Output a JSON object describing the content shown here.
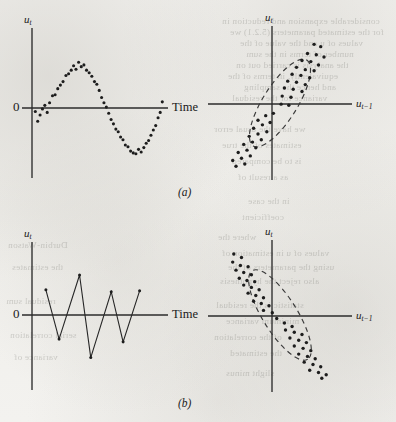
{
  "figure": {
    "background_color": "#f2f1ee",
    "ink_color": "#1d1d1d",
    "panels": [
      {
        "id": "a",
        "caption": "(a)",
        "caption_pos": {
          "x": 178,
          "y": 186
        },
        "charts": [
          {
            "id": "a-left",
            "role": "time-series",
            "y_axis_label": "u",
            "y_axis_sub": "t",
            "x_axis_label": "Time",
            "zero_label": "0"
          },
          {
            "id": "a-right",
            "role": "lag-scatter",
            "y_axis_label": "u",
            "y_axis_sub": "t",
            "x_axis_label": "u",
            "x_axis_sub": "t−1"
          }
        ]
      },
      {
        "id": "b",
        "caption": "(b)",
        "caption_pos": {
          "x": 178,
          "y": 397
        },
        "charts": [
          {
            "id": "b-left",
            "role": "time-series",
            "y_axis_label": "u",
            "y_axis_sub": "t",
            "x_axis_label": "Time",
            "zero_label": "0"
          },
          {
            "id": "b-right",
            "role": "lag-scatter",
            "y_axis_label": "u",
            "y_axis_sub": "t",
            "x_axis_label": "u",
            "x_axis_sub": "t−1"
          }
        ]
      }
    ]
  },
  "labels": {
    "a_left_y": "u",
    "a_left_y_sub": "t",
    "a_left_zero": "0",
    "a_left_x": "Time",
    "a_right_y": "u",
    "a_right_y_sub": "t",
    "a_right_x": "u",
    "a_right_x_sub": "t−1",
    "caption_a": "(a)",
    "b_left_y": "u",
    "b_left_y_sub": "t",
    "b_left_zero": "0",
    "b_left_x": "Time",
    "b_right_y": "u",
    "b_right_y_sub": "t",
    "b_right_x": "u",
    "b_right_x_sub": "t−1",
    "caption_b": "(b)"
  },
  "bleed_text": {
    "lines": [
      {
        "t": "considerable expansion and reduction in",
        "x": 222,
        "y": 16
      },
      {
        "t": "for the estimated parameters (5.2.1) we",
        "x": 230,
        "y": 27
      },
      {
        "t": "values of u and the value of the",
        "x": 240,
        "y": 38
      },
      {
        "t": "number of terms in the sum",
        "x": 246,
        "y": 49
      },
      {
        "t": "the analysis is carried out on",
        "x": 236,
        "y": 60
      },
      {
        "t": "equivalently, in terms of the",
        "x": 228,
        "y": 71
      },
      {
        "t": "and hence the sampling",
        "x": 244,
        "y": 82
      },
      {
        "t": "variance for the residual",
        "x": 232,
        "y": 93
      },
      {
        "t": "we have the usual error",
        "x": 214,
        "y": 124
      },
      {
        "t": "estimates of the true",
        "x": 222,
        "y": 140
      },
      {
        "t": "is to be compared",
        "x": 232,
        "y": 156
      },
      {
        "t": "as a result of",
        "x": 238,
        "y": 172
      },
      {
        "t": "in the case",
        "x": 248,
        "y": 196
      },
      {
        "t": "coefficient",
        "x": 242,
        "y": 212
      },
      {
        "t": "where the",
        "x": 218,
        "y": 232
      },
      {
        "t": "values of u in estimation of",
        "x": 222,
        "y": 248
      },
      {
        "t": "using the parameters of the",
        "x": 228,
        "y": 262
      },
      {
        "t": "also reject the hypothesis",
        "x": 220,
        "y": 276
      },
      {
        "t": "statistic is the residual",
        "x": 216,
        "y": 300
      },
      {
        "t": "minimum variance",
        "x": 226,
        "y": 316
      },
      {
        "t": "of the correlation",
        "x": 214,
        "y": 332
      },
      {
        "t": "the estimated",
        "x": 230,
        "y": 348
      },
      {
        "t": "slight minus",
        "x": 226,
        "y": 368
      },
      {
        "t": "Durbin-Watson",
        "x": 8,
        "y": 240
      },
      {
        "t": "the estimates",
        "x": 12,
        "y": 262
      },
      {
        "t": "residual sum",
        "x": 6,
        "y": 296
      },
      {
        "t": "serial correlation",
        "x": 10,
        "y": 330
      },
      {
        "t": "variance of",
        "x": 14,
        "y": 352
      }
    ]
  },
  "chart_data": [
    {
      "id": "a-left",
      "type": "scatter",
      "title": "",
      "xlabel": "Time",
      "ylabel": "u_t",
      "grid": false,
      "legend": null,
      "description": "Positive autocorrelation: residuals trace a smooth sine-like wave over time.",
      "xlim": [
        0,
        1
      ],
      "ylim": [
        -1.25,
        1.25
      ],
      "points": [
        [
          0.01,
          -0.08
        ],
        [
          0.028,
          -0.3
        ],
        [
          0.046,
          -0.16
        ],
        [
          0.064,
          -0.02
        ],
        [
          0.082,
          0.06
        ],
        [
          0.1,
          -0.1
        ],
        [
          0.118,
          0.12
        ],
        [
          0.14,
          0.28
        ],
        [
          0.16,
          0.3
        ],
        [
          0.18,
          0.44
        ],
        [
          0.2,
          0.52
        ],
        [
          0.22,
          0.6
        ],
        [
          0.242,
          0.74
        ],
        [
          0.262,
          0.78
        ],
        [
          0.282,
          0.86
        ],
        [
          0.3,
          0.96
        ],
        [
          0.318,
          0.88
        ],
        [
          0.338,
          1.04
        ],
        [
          0.358,
          0.94
        ],
        [
          0.378,
          0.98
        ],
        [
          0.398,
          0.86
        ],
        [
          0.418,
          0.8
        ],
        [
          0.438,
          0.72
        ],
        [
          0.458,
          0.6
        ],
        [
          0.476,
          0.54
        ],
        [
          0.494,
          0.4
        ],
        [
          0.512,
          0.24
        ],
        [
          0.53,
          0.12
        ],
        [
          0.548,
          0.02
        ],
        [
          0.566,
          -0.12
        ],
        [
          0.584,
          -0.26
        ],
        [
          0.602,
          -0.36
        ],
        [
          0.62,
          -0.48
        ],
        [
          0.638,
          -0.54
        ],
        [
          0.656,
          -0.66
        ],
        [
          0.674,
          -0.72
        ],
        [
          0.692,
          -0.84
        ],
        [
          0.712,
          -0.88
        ],
        [
          0.732,
          -0.98
        ],
        [
          0.752,
          -1.02
        ],
        [
          0.772,
          -1.04
        ],
        [
          0.792,
          -0.94
        ],
        [
          0.812,
          -1.0
        ],
        [
          0.832,
          -0.9
        ],
        [
          0.85,
          -0.8
        ],
        [
          0.868,
          -0.74
        ],
        [
          0.886,
          -0.62
        ],
        [
          0.904,
          -0.5
        ],
        [
          0.922,
          -0.4
        ],
        [
          0.94,
          -0.22
        ],
        [
          0.956,
          -0.1
        ],
        [
          0.972,
          0.14
        ]
      ]
    },
    {
      "id": "a-right",
      "type": "scatter",
      "title": "",
      "xlabel": "u_{t-1}",
      "ylabel": "u_t",
      "grid": false,
      "legend": null,
      "description": "Positive autocorrelation: lag-1 scatter falls in a narrow upward-sloping dashed ellipse through quadrants I and III.",
      "xlim": [
        -1.2,
        1.2
      ],
      "ylim": [
        -1.2,
        1.2
      ],
      "ellipse": {
        "cx": 0.0,
        "cy": 0.0,
        "rx": 0.92,
        "ry": 0.3,
        "rotation_deg": -58
      },
      "points": [
        [
          0.62,
          1.02
        ],
        [
          0.74,
          0.98
        ],
        [
          0.5,
          0.86
        ],
        [
          0.66,
          0.84
        ],
        [
          0.8,
          0.8
        ],
        [
          0.4,
          0.74
        ],
        [
          0.56,
          0.72
        ],
        [
          0.7,
          0.66
        ],
        [
          0.3,
          0.62
        ],
        [
          0.46,
          0.58
        ],
        [
          0.62,
          0.56
        ],
        [
          0.22,
          0.5
        ],
        [
          0.38,
          0.48
        ],
        [
          0.54,
          0.44
        ],
        [
          0.14,
          0.38
        ],
        [
          0.3,
          0.36
        ],
        [
          0.46,
          0.32
        ],
        [
          0.08,
          0.26
        ],
        [
          0.24,
          0.24
        ],
        [
          0.4,
          0.2
        ],
        [
          0.04,
          0.12
        ],
        [
          0.2,
          0.1
        ],
        [
          0.02,
          -0.02
        ],
        [
          0.16,
          -0.04
        ],
        [
          -0.12,
          -0.18
        ],
        [
          -0.26,
          -0.22
        ],
        [
          -0.4,
          -0.3
        ],
        [
          -0.18,
          -0.34
        ],
        [
          -0.32,
          -0.38
        ],
        [
          -0.48,
          -0.44
        ],
        [
          -0.24,
          -0.5
        ],
        [
          -0.4,
          -0.54
        ],
        [
          -0.56,
          -0.58
        ],
        [
          -0.34,
          -0.64
        ],
        [
          -0.5,
          -0.68
        ],
        [
          -0.66,
          -0.72
        ],
        [
          -0.44,
          -0.78
        ],
        [
          -0.6,
          -0.82
        ],
        [
          -0.76,
          -0.86
        ],
        [
          -0.54,
          -0.92
        ],
        [
          -0.7,
          -0.96
        ],
        [
          -0.86,
          -1.0
        ],
        [
          -0.64,
          -1.06
        ],
        [
          -0.8,
          -1.1
        ]
      ]
    },
    {
      "id": "b-left",
      "type": "line",
      "title": "",
      "xlabel": "Time",
      "ylabel": "u_t",
      "grid": false,
      "legend": null,
      "description": "Negative autocorrelation: residuals alternate sign, producing a sawtooth / zigzag line.",
      "xlim": [
        0,
        1
      ],
      "ylim": [
        -1.25,
        1.25
      ],
      "vertices": [
        [
          0.09,
          0.52
        ],
        [
          0.19,
          -0.54
        ],
        [
          0.345,
          0.84
        ],
        [
          0.43,
          -0.94
        ],
        [
          0.585,
          0.48
        ],
        [
          0.675,
          -0.6
        ],
        [
          0.8,
          0.5
        ]
      ]
    },
    {
      "id": "b-right",
      "type": "scatter",
      "title": "",
      "xlabel": "u_{t-1}",
      "ylabel": "u_t",
      "grid": false,
      "legend": null,
      "description": "Negative autocorrelation: lag-1 scatter falls in a narrow downward-sloping dashed ellipse through quadrants II and IV.",
      "xlim": [
        -1.2,
        1.2
      ],
      "ylim": [
        -1.2,
        1.2
      ],
      "ellipse": {
        "cx": 0.0,
        "cy": 0.0,
        "rx": 0.95,
        "ry": 0.3,
        "rotation_deg": 58
      },
      "points": [
        [
          -0.84,
          1.06
        ],
        [
          -0.7,
          1.0
        ],
        [
          -0.86,
          0.92
        ],
        [
          -0.72,
          0.86
        ],
        [
          -0.58,
          0.84
        ],
        [
          -0.8,
          0.78
        ],
        [
          -0.66,
          0.74
        ],
        [
          -0.52,
          0.7
        ],
        [
          -0.74,
          0.64
        ],
        [
          -0.6,
          0.6
        ],
        [
          -0.46,
          0.58
        ],
        [
          -0.66,
          0.52
        ],
        [
          -0.52,
          0.48
        ],
        [
          -0.38,
          0.44
        ],
        [
          -0.58,
          0.38
        ],
        [
          -0.44,
          0.34
        ],
        [
          -0.3,
          0.3
        ],
        [
          -0.48,
          0.24
        ],
        [
          -0.34,
          0.2
        ],
        [
          -0.2,
          0.16
        ],
        [
          -0.3,
          0.08
        ],
        [
          -0.14,
          0.04
        ],
        [
          -0.06,
          -0.06
        ],
        [
          0.08,
          -0.14
        ],
        [
          0.22,
          -0.2
        ],
        [
          0.1,
          -0.26
        ],
        [
          0.26,
          -0.3
        ],
        [
          0.4,
          -0.34
        ],
        [
          0.18,
          -0.4
        ],
        [
          0.34,
          -0.44
        ],
        [
          0.48,
          -0.48
        ],
        [
          0.26,
          -0.54
        ],
        [
          0.42,
          -0.58
        ],
        [
          0.56,
          -0.62
        ],
        [
          0.34,
          -0.68
        ],
        [
          0.5,
          -0.72
        ],
        [
          0.64,
          -0.76
        ],
        [
          0.44,
          -0.82
        ],
        [
          0.6,
          -0.86
        ],
        [
          0.74,
          -0.9
        ],
        [
          0.54,
          -0.96
        ],
        [
          0.7,
          -1.0
        ],
        [
          0.84,
          -1.04
        ],
        [
          0.76,
          -1.1
        ]
      ]
    }
  ]
}
